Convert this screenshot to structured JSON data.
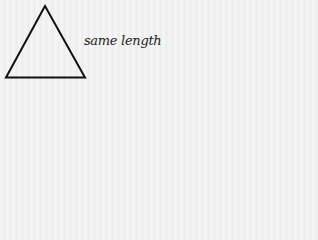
{
  "diagram": {
    "shape": "equilateral-triangle",
    "label": "same length",
    "stroke_color": "#111111",
    "vertices": [
      [
        45,
        5
      ],
      [
        6,
        78
      ],
      [
        85,
        78
      ]
    ]
  }
}
